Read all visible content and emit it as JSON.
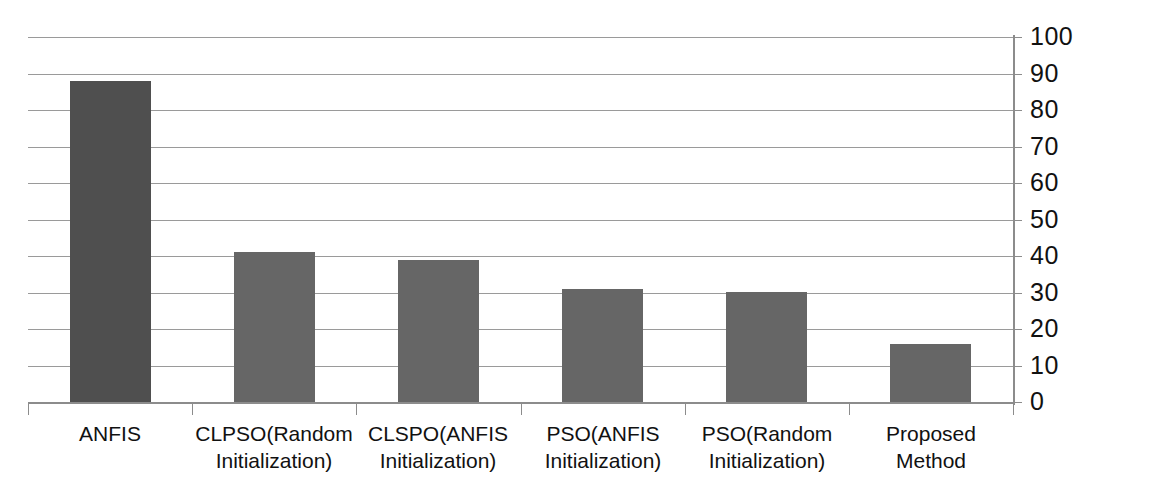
{
  "chart_data": {
    "type": "bar",
    "title": "",
    "subtitle": "",
    "xlabel": "",
    "ylabel": "",
    "categories": [
      "ANFIS",
      "CLPSO(Random Initialization)",
      "CLSPO(ANFIS Initialization)",
      "PSO(ANFIS Initialization)",
      "PSO(Random Initialization)",
      "Proposed Method"
    ],
    "category_lines": [
      [
        "ANFIS"
      ],
      [
        "CLPSO(Random",
        "Initialization)"
      ],
      [
        "CLSPO(ANFIS",
        "Initialization)"
      ],
      [
        "PSO(ANFIS",
        "Initialization)"
      ],
      [
        "PSO(Random",
        "Initialization)"
      ],
      [
        "Proposed Method"
      ]
    ],
    "values": [
      88,
      41,
      39,
      31,
      30,
      16
    ],
    "ylim": [
      0,
      100
    ],
    "ytick_step": 10,
    "ytick_labels": [
      "0",
      "10",
      "20",
      "30",
      "40",
      "50",
      "60",
      "70",
      "80",
      "90",
      "100"
    ],
    "grid": true,
    "grid_axis": "y",
    "legend": "none",
    "axis_position": "right",
    "bar_colors": [
      "#4f4f4f",
      "#666666",
      "#666666",
      "#666666",
      "#666666",
      "#666666"
    ],
    "gridline_color": "#9a9a9a",
    "axis_color": "#8c8c8c",
    "background": "#ffffff"
  }
}
